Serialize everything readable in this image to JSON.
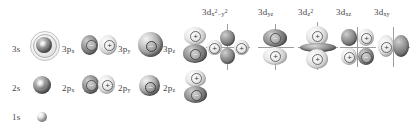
{
  "diagram": {
    "background_color": "#ffffff",
    "label_color": "#444444",
    "rows": [
      {
        "name": "n3",
        "labels": [
          "3s",
          "3p",
          "3p",
          "3p"
        ],
        "orbitals": [
          {
            "label": "3s",
            "sub": "",
            "type": "sphere-shells"
          },
          {
            "label": "3p",
            "sub": "x",
            "type": "p-lobes-horizontal",
            "signs": [
              "−",
              "+"
            ]
          },
          {
            "label": "3p",
            "sub": "y",
            "type": "p-lobe-front",
            "signs": [
              "−"
            ]
          },
          {
            "label": "3p",
            "sub": "z",
            "type": "p-lobes-vertical",
            "signs": [
              "+",
              "−"
            ]
          }
        ]
      },
      {
        "name": "n2",
        "labels": [
          "2s",
          "2p",
          "2p",
          "2p"
        ],
        "orbitals": [
          {
            "label": "2s",
            "sub": "",
            "type": "sphere"
          },
          {
            "label": "2p",
            "sub": "x",
            "type": "p-lobes-horizontal",
            "signs": [
              "−",
              "+"
            ]
          },
          {
            "label": "2p",
            "sub": "y",
            "type": "p-lobe-front",
            "signs": [
              "−"
            ]
          },
          {
            "label": "2p",
            "sub": "z",
            "type": "p-lobes-vertical",
            "signs": [
              "+",
              "−"
            ]
          }
        ]
      },
      {
        "name": "n1",
        "labels": [
          "1s"
        ],
        "orbitals": [
          {
            "label": "1s",
            "sub": "",
            "type": "sphere-small"
          }
        ]
      }
    ],
    "d_orbitals": [
      {
        "label": "3d",
        "sub_main": "x",
        "sub_sup": "2",
        "sub_tail": "−y",
        "sub_tail_sup": "2",
        "full": "3d x2-y2",
        "type": "d-cloverleaf-axial",
        "signs": [
          "+",
          "−",
          "+",
          "−"
        ]
      },
      {
        "label": "3d",
        "sub_main": "yz",
        "sub_sup": "",
        "sub_tail": "",
        "sub_tail_sup": "",
        "full": "3d yz",
        "type": "d-vertical-pair",
        "signs": [
          "−",
          "+"
        ]
      },
      {
        "label": "3d",
        "sub_main": "z",
        "sub_sup": "2",
        "sub_tail": "",
        "sub_tail_sup": "",
        "full": "3d z2",
        "type": "d-z2-torus",
        "signs": [
          "+",
          "+"
        ]
      },
      {
        "label": "3d",
        "sub_main": "xz",
        "sub_sup": "",
        "sub_tail": "",
        "sub_tail_sup": "",
        "full": "3d xz",
        "type": "d-cloverleaf-diagonal",
        "signs": [
          "−",
          "+",
          "+",
          "−"
        ]
      },
      {
        "label": "3d",
        "sub_main": "xy",
        "sub_sup": "",
        "sub_tail": "",
        "sub_tail_sup": "",
        "full": "3d xy",
        "type": "d-cloverleaf-horizontal",
        "signs": [
          "+",
          "−"
        ]
      }
    ],
    "signs": {
      "plus": "+",
      "minus": "−"
    }
  }
}
